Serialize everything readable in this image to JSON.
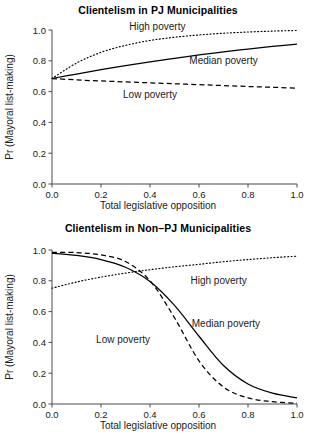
{
  "figure": {
    "background": "#ffffff",
    "line_color": "#000000"
  },
  "panels": [
    {
      "id": "top",
      "title": "Clientelism in PJ Municipalities",
      "xlabel": "Total legislative opposition",
      "ylabel": "Pr (Mayoral list-making)",
      "labels": {
        "high": "High poverty",
        "median": "Median poverty",
        "low": "Low poverty"
      }
    },
    {
      "id": "bottom",
      "title": "Clientelism in Non–PJ Municipalities",
      "xlabel": "Total legislative opposition",
      "ylabel": "Pr (Mayoral list-making)",
      "labels": {
        "high": "High poverty",
        "median": "Median poverty",
        "low": "Low poverty"
      }
    }
  ],
  "chart_data": [
    {
      "type": "line",
      "title": "Clientelism in PJ Municipalities",
      "xlabel": "Total legislative opposition",
      "ylabel": "Pr (Mayoral list-making)",
      "xlim": [
        0.0,
        1.0
      ],
      "ylim": [
        0.0,
        1.0
      ],
      "xticks": [
        0.0,
        0.2,
        0.4,
        0.6,
        0.8,
        1.0
      ],
      "yticks": [
        0.0,
        0.2,
        0.4,
        0.6,
        0.8,
        1.0
      ],
      "xticklabels": [
        "0.0",
        "0.2",
        "0.4",
        "0.6",
        "0.8",
        "1.0"
      ],
      "yticklabels": [
        "0.0",
        "0.2",
        "0.4",
        "0.6",
        "0.8",
        "1.0"
      ],
      "grid": false,
      "legend": "inline-annotations",
      "x": [
        0.0,
        0.1,
        0.2,
        0.3,
        0.4,
        0.5,
        0.6,
        0.7,
        0.8,
        0.9,
        1.0
      ],
      "series": [
        {
          "name": "High poverty",
          "style": "dotted",
          "values": [
            0.685,
            0.785,
            0.855,
            0.9,
            0.932,
            0.953,
            0.968,
            0.979,
            0.987,
            0.993,
            0.997
          ],
          "annotation": {
            "text": "High poverty",
            "x": 0.43,
            "y": 1.02
          }
        },
        {
          "name": "Median poverty",
          "style": "solid",
          "values": [
            0.685,
            0.714,
            0.742,
            0.768,
            0.793,
            0.816,
            0.838,
            0.858,
            0.876,
            0.893,
            0.909
          ],
          "annotation": {
            "text": "Median poverty",
            "x": 0.7,
            "y": 0.8
          }
        },
        {
          "name": "Low poverty",
          "style": "dashed",
          "values": [
            0.685,
            0.676,
            0.669,
            0.663,
            0.657,
            0.651,
            0.645,
            0.639,
            0.633,
            0.628,
            0.622
          ],
          "annotation": {
            "text": "Low poverty",
            "x": 0.4,
            "y": 0.58
          }
        }
      ]
    },
    {
      "type": "line",
      "title": "Clientelism in Non–PJ Municipalities",
      "xlabel": "Total legislative opposition",
      "ylabel": "Pr (Mayoral list-making)",
      "xlim": [
        0.0,
        1.0
      ],
      "ylim": [
        0.0,
        1.0
      ],
      "xticks": [
        0.0,
        0.2,
        0.4,
        0.6,
        0.8,
        1.0
      ],
      "yticks": [
        0.0,
        0.2,
        0.4,
        0.6,
        0.8,
        1.0
      ],
      "xticklabels": [
        "0.0",
        "0.2",
        "0.4",
        "0.6",
        "0.8",
        "1.0"
      ],
      "yticklabels": [
        "0.0",
        "0.2",
        "0.4",
        "0.6",
        "0.8",
        "1.0"
      ],
      "grid": false,
      "legend": "inline-annotations",
      "x": [
        0.0,
        0.1,
        0.2,
        0.3,
        0.4,
        0.5,
        0.6,
        0.7,
        0.8,
        0.9,
        1.0
      ],
      "series": [
        {
          "name": "High poverty",
          "style": "dotted",
          "values": [
            0.752,
            0.792,
            0.824,
            0.85,
            0.872,
            0.891,
            0.907,
            0.924,
            0.938,
            0.95,
            0.96
          ],
          "annotation": {
            "text": "High poverty",
            "x": 0.68,
            "y": 0.8
          }
        },
        {
          "name": "Median poverty",
          "style": "solid",
          "values": [
            0.979,
            0.965,
            0.938,
            0.888,
            0.795,
            0.64,
            0.44,
            0.25,
            0.13,
            0.07,
            0.04
          ],
          "annotation": {
            "text": "Median poverty",
            "x": 0.71,
            "y": 0.52
          }
        },
        {
          "name": "Low poverty",
          "style": "dashed",
          "values": [
            0.985,
            0.983,
            0.968,
            0.925,
            0.8,
            0.56,
            0.28,
            0.11,
            0.04,
            0.015,
            0.005
          ],
          "annotation": {
            "text": "Low poverty",
            "x": 0.29,
            "y": 0.42
          }
        }
      ]
    }
  ]
}
